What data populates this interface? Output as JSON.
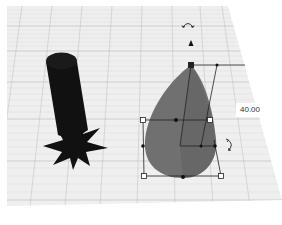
{
  "viewport": {
    "background": "#ffffff",
    "grid_plane_color": "#efefef",
    "grid_line_color": "#c8c8c8"
  },
  "objects": [
    {
      "name": "cylinder-with-star-base",
      "color": "#111111"
    },
    {
      "name": "paraboloid-shape",
      "color": "#6e6e6e",
      "selected": true
    }
  ],
  "selection": {
    "dimension_value": "40.00",
    "handles": [
      "top-handle",
      "left-handle",
      "right-handle",
      "bottom-left-handle",
      "bottom-right-handle",
      "bottom-center-handle"
    ],
    "rotate_icon_top": "rotate-arc-icon",
    "rotate_icon_side": "rotate-arrow-icon",
    "lift_icon": "cone-lift-icon"
  }
}
